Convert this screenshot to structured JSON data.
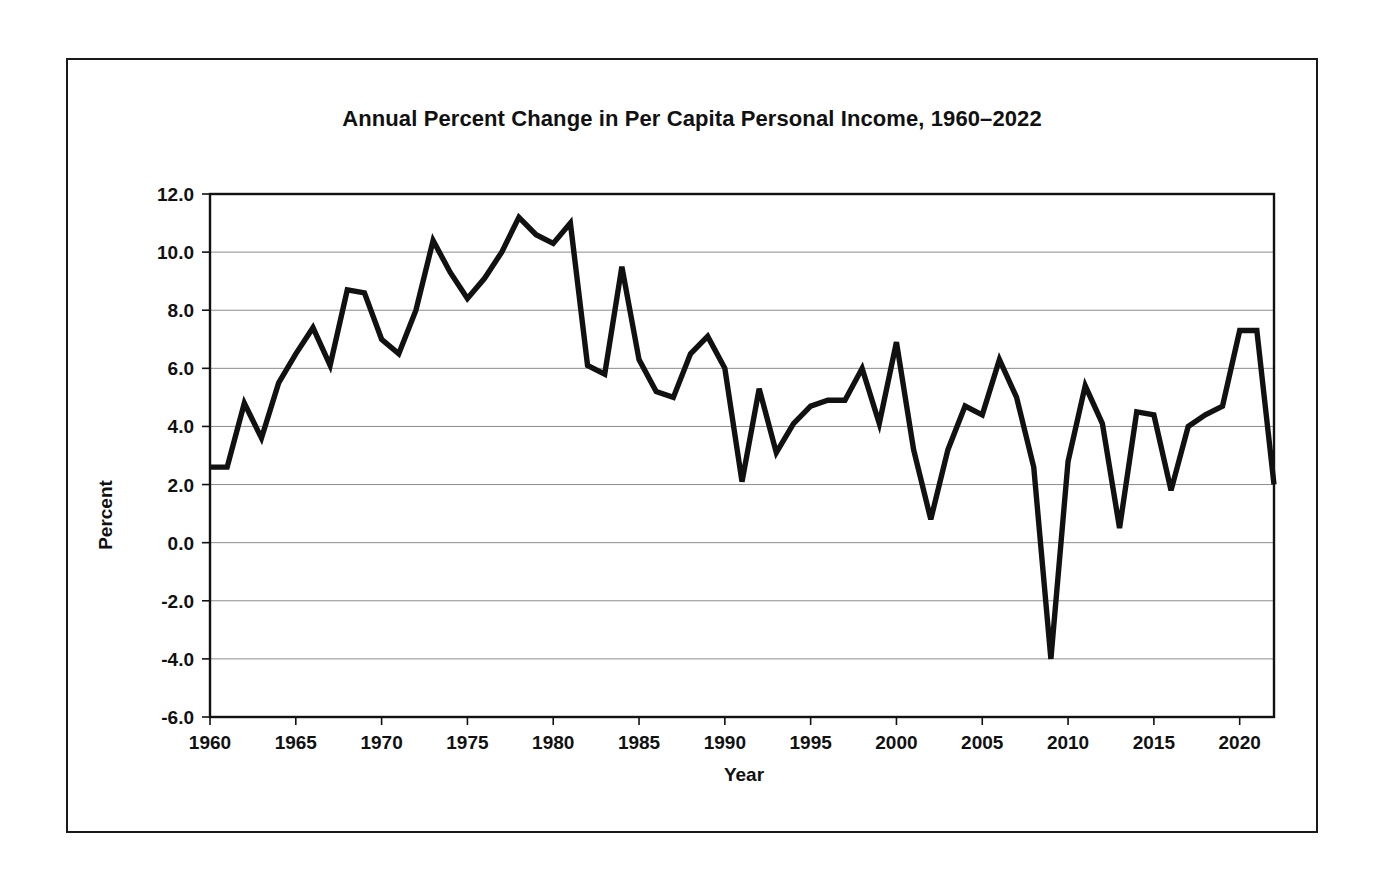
{
  "figure": {
    "title": "Annual Percent Change in Per Capita Personal Income, 1960–2022",
    "border_color": "#1a1a1a",
    "background_color": "#ffffff"
  },
  "axes": {
    "x_title": "Year",
    "y_title": "Percent",
    "x_tick_labels": [
      "1960",
      "1965",
      "1970",
      "1975",
      "1980",
      "1985",
      "1990",
      "1995",
      "2000",
      "2005",
      "2010",
      "2015",
      "2020"
    ],
    "y_tick_labels": [
      "12.0",
      "10.0",
      "8.0",
      "6.0",
      "4.0",
      "2.0",
      "0.0",
      "-2.0",
      "-4.0",
      "-6.0"
    ]
  },
  "chart_data": {
    "type": "line",
    "title": "Annual Percent Change in Per Capita Personal Income, 1960–2022",
    "xlabel": "Year",
    "ylabel": "Percent",
    "xlim": [
      1960,
      2022
    ],
    "ylim": [
      -6.0,
      12.0
    ],
    "ytick_step": 2.0,
    "xtick_step": 5,
    "grid": true,
    "legend": false,
    "line_color": "#111111",
    "x": [
      1960,
      1961,
      1962,
      1963,
      1964,
      1965,
      1966,
      1967,
      1968,
      1969,
      1970,
      1971,
      1972,
      1973,
      1974,
      1975,
      1976,
      1977,
      1978,
      1979,
      1980,
      1981,
      1982,
      1983,
      1984,
      1985,
      1986,
      1987,
      1988,
      1989,
      1990,
      1991,
      1992,
      1993,
      1994,
      1995,
      1996,
      1997,
      1998,
      1999,
      2000,
      2001,
      2002,
      2003,
      2004,
      2005,
      2006,
      2007,
      2008,
      2009,
      2010,
      2011,
      2012,
      2013,
      2014,
      2015,
      2016,
      2017,
      2018,
      2019,
      2020,
      2021,
      2022
    ],
    "y": [
      2.6,
      2.6,
      4.8,
      3.6,
      5.5,
      6.5,
      7.4,
      6.1,
      8.7,
      8.6,
      7.0,
      6.5,
      8.0,
      10.4,
      9.3,
      8.4,
      9.1,
      10.0,
      11.2,
      10.6,
      10.3,
      11.0,
      6.1,
      5.8,
      9.5,
      6.3,
      5.2,
      5.0,
      6.5,
      7.1,
      6.0,
      2.1,
      5.3,
      3.1,
      4.1,
      4.7,
      4.9,
      4.9,
      6.0,
      4.1,
      6.9,
      3.2,
      0.8,
      3.2,
      4.7,
      4.4,
      6.3,
      5.0,
      2.6,
      -4.0,
      2.8,
      5.4,
      4.1,
      0.5,
      4.5,
      4.4,
      1.8,
      4.0,
      4.4,
      4.7,
      7.3,
      7.3,
      2.0
    ],
    "series": [
      {
        "name": "Annual percent change in per capita personal income",
        "values": [
          2.6,
          2.6,
          4.8,
          3.6,
          5.5,
          6.5,
          7.4,
          6.1,
          8.7,
          8.6,
          7.0,
          6.5,
          8.0,
          10.4,
          9.3,
          8.4,
          9.1,
          10.0,
          11.2,
          10.6,
          10.3,
          11.0,
          6.1,
          5.8,
          9.5,
          6.3,
          5.2,
          5.0,
          6.5,
          7.1,
          6.0,
          2.1,
          5.3,
          3.1,
          4.1,
          4.7,
          4.9,
          4.9,
          6.0,
          4.1,
          6.9,
          3.2,
          0.8,
          3.2,
          4.7,
          4.4,
          6.3,
          5.0,
          2.6,
          -4.0,
          2.8,
          5.4,
          4.1,
          0.5,
          4.5,
          4.4,
          1.8,
          4.0,
          4.4,
          4.7,
          7.3,
          7.3,
          2.0
        ]
      }
    ]
  }
}
